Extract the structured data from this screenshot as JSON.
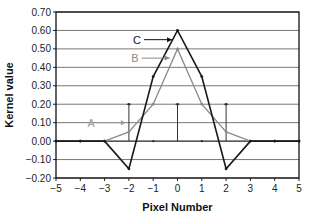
{
  "chart_data": {
    "type": "line",
    "title": "",
    "xlabel": "Pixel Number",
    "ylabel": "Kernel value",
    "xlim": [
      -5,
      5
    ],
    "ylim": [
      -0.2,
      0.7
    ],
    "x_ticks": [
      "−5",
      "−4",
      "−3",
      "−2",
      "−1",
      "0",
      "1",
      "2",
      "3",
      "4",
      "5"
    ],
    "y_ticks": [
      "0.70",
      "0.60",
      "0.50",
      "0.40",
      "0.30",
      "0.20",
      "0.10",
      "0.00",
      "−0.10",
      "−0.20"
    ],
    "y_tick_values": [
      0.7,
      0.6,
      0.5,
      0.4,
      0.3,
      0.2,
      0.1,
      0.0,
      -0.1,
      -0.2
    ],
    "grid": "horizontal",
    "series": [
      {
        "name": "A",
        "style": "stem",
        "color": "#333333",
        "x": [
          -5,
          -4,
          -3,
          -2,
          -1,
          0,
          1,
          2,
          3,
          4,
          5
        ],
        "values": [
          0,
          0,
          0,
          0.2,
          0,
          0.2,
          0,
          0.2,
          0,
          0,
          0
        ]
      },
      {
        "name": "B",
        "style": "line",
        "color": "#8a8a8a",
        "x": [
          -5,
          -4,
          -3,
          -2,
          -1,
          0,
          1,
          2,
          3,
          4,
          5
        ],
        "values": [
          0,
          0,
          0,
          0.05,
          0.2,
          0.5,
          0.2,
          0.05,
          0,
          0,
          0
        ]
      },
      {
        "name": "C",
        "style": "line",
        "color": "#1a1a1a",
        "x": [
          -5,
          -4,
          -3,
          -2,
          -1,
          0,
          1,
          2,
          3,
          4,
          5
        ],
        "values": [
          0,
          0,
          0,
          -0.15,
          0.35,
          0.6,
          0.35,
          -0.15,
          0,
          0,
          0
        ]
      }
    ],
    "annotations": [
      {
        "label": "A",
        "points_to_x": -2,
        "points_to_y": 0.1,
        "color": "#999999"
      },
      {
        "label": "B",
        "points_to_x": -0.2,
        "points_to_y": 0.45,
        "color": "#888888"
      },
      {
        "label": "C",
        "points_to_x": -0.1,
        "points_to_y": 0.55,
        "color": "#111111"
      }
    ]
  }
}
